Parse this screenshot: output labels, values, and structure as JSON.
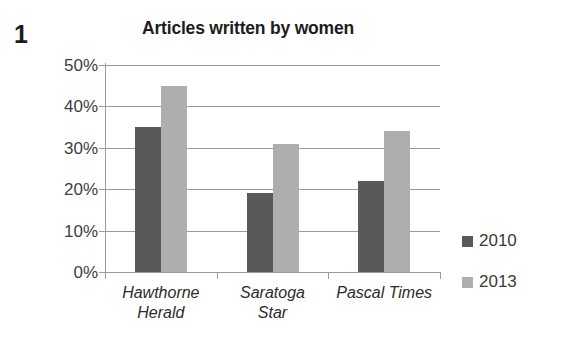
{
  "question": {
    "number": "1"
  },
  "chart_data": {
    "type": "bar",
    "title": "Articles written by women",
    "xlabel": "",
    "ylabel": "",
    "ylim": [
      0,
      50
    ],
    "y_unit": "%",
    "grid": true,
    "legend_position": "right",
    "categories": [
      "Hawthorne Herald",
      "Saratoga Star",
      "Pascal Times"
    ],
    "category_lines": [
      [
        "Hawthorne",
        "Herald"
      ],
      [
        "Saratoga",
        "Star"
      ],
      [
        "Pascal Times",
        ""
      ]
    ],
    "y_ticks": [
      0,
      10,
      20,
      30,
      40,
      50
    ],
    "y_tick_labels": [
      "0%",
      "10%",
      "20%",
      "30%",
      "40%",
      "50%"
    ],
    "series": [
      {
        "name": "2010",
        "color": "#595959",
        "values": [
          35,
          19,
          22
        ]
      },
      {
        "name": "2013",
        "color": "#aeaeae",
        "values": [
          45,
          31,
          34
        ]
      }
    ]
  },
  "colors": {
    "series_2010": "#595959",
    "series_2013": "#aeaeae",
    "gridline": "#9b9b9b",
    "text": "#3c3c3c",
    "background": "#ffffff"
  }
}
